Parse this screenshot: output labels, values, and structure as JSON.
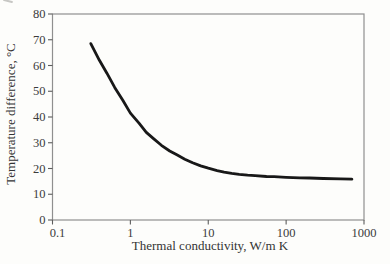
{
  "figure": {
    "background": "#fdfdfb",
    "frame_color": "#8f8f8f",
    "tick_color": "#5c5c5c",
    "text_color": "#3b3b3b"
  },
  "chart_data": {
    "type": "line",
    "title": "",
    "xlabel": "Thermal conductivity, W/m K",
    "ylabel": "Temperature difference, °C",
    "x_scale": "log",
    "y_scale": "linear",
    "xlim": [
      0.1,
      1000
    ],
    "ylim": [
      0,
      80
    ],
    "x_ticks": [
      "0.1",
      "1",
      "10",
      "100",
      "1000"
    ],
    "y_ticks": [
      "0",
      "10",
      "20",
      "30",
      "40",
      "50",
      "60",
      "70",
      "80"
    ],
    "grid": false,
    "legend": false,
    "line_color": "#181818",
    "line_width": 2.8,
    "series": [
      {
        "name": "temperature-difference-vs-conductivity",
        "points": [
          [
            0.31,
            68.5
          ],
          [
            0.4,
            62.0
          ],
          [
            0.5,
            57.0
          ],
          [
            0.63,
            51.5
          ],
          [
            0.8,
            46.5
          ],
          [
            1.0,
            41.5
          ],
          [
            1.3,
            37.5
          ],
          [
            1.6,
            34.0
          ],
          [
            2.0,
            31.5
          ],
          [
            2.5,
            29.0
          ],
          [
            3.2,
            26.8
          ],
          [
            4.0,
            25.2
          ],
          [
            5.0,
            23.6
          ],
          [
            6.3,
            22.2
          ],
          [
            8.0,
            21.0
          ],
          [
            10,
            20.1
          ],
          [
            13,
            19.2
          ],
          [
            16,
            18.6
          ],
          [
            20,
            18.1
          ],
          [
            25,
            17.7
          ],
          [
            32,
            17.4
          ],
          [
            40,
            17.2
          ],
          [
            56,
            16.9
          ],
          [
            70,
            16.8
          ],
          [
            100,
            16.6
          ],
          [
            150,
            16.4
          ],
          [
            200,
            16.3
          ],
          [
            300,
            16.1
          ],
          [
            500,
            16.0
          ],
          [
            700,
            15.9
          ]
        ]
      }
    ]
  }
}
